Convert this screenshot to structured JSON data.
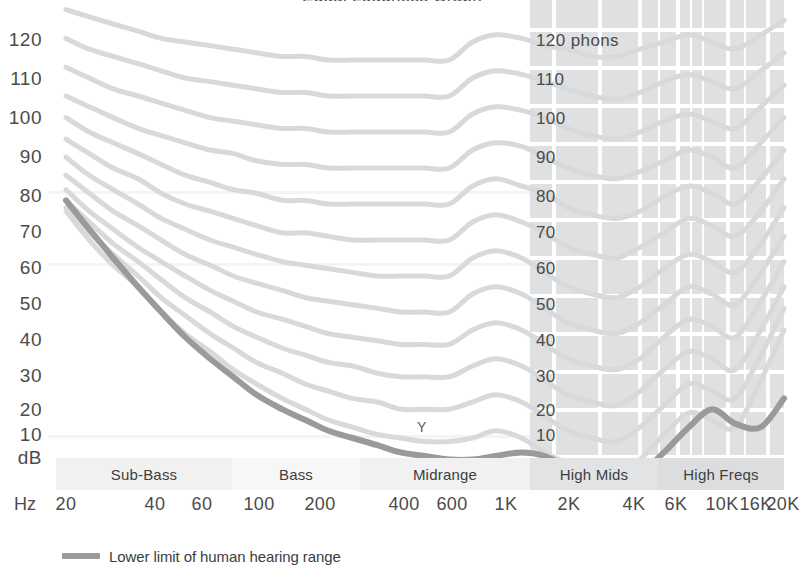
{
  "title": "Equal Loudness Graph",
  "axes": {
    "y_unit": "dB",
    "x_unit": "Hz",
    "y_ticks": [
      "120",
      "110",
      "100",
      "90",
      "80",
      "70",
      "60",
      "50",
      "40",
      "30",
      "20",
      "10"
    ],
    "x_ticks": [
      "20",
      "40",
      "60",
      "100",
      "200",
      "400",
      "600",
      "1K",
      "2K",
      "4K",
      "6K",
      "10K",
      "16K",
      "20K"
    ]
  },
  "phon_labels": [
    "120 phons",
    "110",
    "100",
    "90",
    "80",
    "70",
    "60",
    "50",
    "40",
    "30",
    "20",
    "10"
  ],
  "bands": [
    {
      "label": "Sub-Bass"
    },
    {
      "label": "Bass"
    },
    {
      "label": "Midrange"
    },
    {
      "label": "High Mids"
    },
    {
      "label": "High Freqs"
    }
  ],
  "annotation": "Y",
  "legend": {
    "label": "Lower limit of human hearing range",
    "color": "#9a9a9a"
  },
  "colors": {
    "contour": "#d8d9db",
    "threshold": "#9a9a9a",
    "panel": "#dfe0e2",
    "grid": "#ffffff",
    "text": "#4b4b4b"
  },
  "chart_data": {
    "type": "line",
    "title": "Equal Loudness Graph",
    "xlabel": "Hz",
    "ylabel": "dB",
    "xscale": "log",
    "xlim": [
      20,
      20000
    ],
    "ylim": [
      0,
      130
    ],
    "grid": "partial (white grid over shaded high-frequency panel)",
    "legend": "bottom-left",
    "x": [
      20,
      25,
      31.5,
      40,
      50,
      63,
      80,
      100,
      125,
      160,
      200,
      250,
      315,
      400,
      500,
      630,
      800,
      1000,
      1250,
      1600,
      2000,
      2500,
      3150,
      4000,
      5000,
      6300,
      8000,
      10000,
      12500,
      16000,
      20000
    ],
    "series": [
      {
        "name": "120 phons",
        "phon": 120,
        "values": [
          129,
          127,
          125,
          123,
          121,
          120,
          119,
          118,
          117,
          116,
          116,
          115,
          115,
          115,
          115,
          115,
          115,
          120,
          122,
          121,
          119,
          118,
          116,
          116,
          118,
          120,
          122,
          120,
          118,
          122,
          126
        ]
      },
      {
        "name": "110 phons",
        "phon": 110,
        "values": [
          121,
          118,
          116,
          114,
          112,
          110,
          109,
          108,
          107,
          106,
          106,
          105,
          105,
          105,
          105,
          105,
          105,
          110,
          112,
          111,
          109,
          107,
          105,
          104,
          106,
          109,
          111,
          109,
          107,
          112,
          117
        ]
      },
      {
        "name": "100 phons",
        "phon": 100,
        "values": [
          113,
          110,
          107,
          105,
          103,
          101,
          99,
          98,
          97,
          96,
          96,
          95,
          95,
          95,
          95,
          95,
          95,
          100,
          102,
          101,
          99,
          96,
          94,
          93,
          95,
          98,
          100,
          98,
          96,
          102,
          108
        ]
      },
      {
        "name": "90 phons",
        "phon": 90,
        "values": [
          105,
          102,
          99,
          96,
          94,
          92,
          90,
          89,
          87,
          86,
          86,
          85,
          85,
          85,
          85,
          85,
          85,
          90,
          92,
          91,
          88,
          85,
          83,
          82,
          84,
          87,
          90,
          88,
          85,
          92,
          99
        ]
      },
      {
        "name": "80 phons",
        "phon": 80,
        "values": [
          99,
          95,
          92,
          89,
          86,
          83,
          81,
          79,
          78,
          76,
          76,
          75,
          75,
          75,
          75,
          75,
          75,
          80,
          82,
          80,
          78,
          74,
          72,
          71,
          73,
          77,
          80,
          78,
          75,
          82,
          90
        ]
      },
      {
        "name": "70 phons",
        "phon": 70,
        "values": [
          93,
          89,
          85,
          82,
          78,
          75,
          73,
          71,
          69,
          67,
          67,
          66,
          65,
          65,
          65,
          65,
          65,
          70,
          72,
          70,
          67,
          63,
          61,
          60,
          63,
          67,
          71,
          69,
          66,
          73,
          82
        ]
      },
      {
        "name": "60 phons",
        "phon": 60,
        "values": [
          88,
          83,
          79,
          75,
          71,
          68,
          65,
          63,
          61,
          59,
          58,
          57,
          56,
          55,
          55,
          55,
          55,
          60,
          62,
          60,
          56,
          52,
          50,
          49,
          52,
          57,
          61,
          59,
          56,
          64,
          74
        ]
      },
      {
        "name": "50 phons",
        "phon": 50,
        "values": [
          83,
          78,
          73,
          69,
          65,
          61,
          58,
          55,
          53,
          51,
          49,
          48,
          47,
          46,
          45,
          45,
          45,
          50,
          52,
          50,
          46,
          42,
          40,
          39,
          42,
          47,
          52,
          50,
          47,
          56,
          66
        ]
      },
      {
        "name": "40 phons",
        "phon": 40,
        "values": [
          79,
          73,
          68,
          63,
          59,
          55,
          51,
          48,
          45,
          43,
          41,
          39,
          38,
          37,
          36,
          36,
          36,
          40,
          42,
          40,
          36,
          32,
          30,
          29,
          32,
          38,
          43,
          41,
          38,
          48,
          59
        ]
      },
      {
        "name": "30 phons",
        "phon": 30,
        "values": [
          76,
          70,
          64,
          59,
          54,
          49,
          45,
          41,
          38,
          35,
          33,
          31,
          30,
          28,
          27,
          27,
          27,
          30,
          32,
          30,
          26,
          22,
          20,
          19,
          23,
          29,
          34,
          32,
          29,
          40,
          52
        ]
      },
      {
        "name": "20 phons",
        "phon": 20,
        "values": [
          74,
          67,
          61,
          55,
          49,
          44,
          39,
          35,
          31,
          28,
          25,
          23,
          21,
          20,
          18,
          18,
          18,
          20,
          22,
          20,
          16,
          12,
          10,
          9,
          13,
          19,
          25,
          23,
          21,
          33,
          46
        ]
      },
      {
        "name": "10 phons",
        "phon": 10,
        "values": [
          73,
          65,
          58,
          52,
          45,
          39,
          34,
          29,
          25,
          21,
          18,
          15,
          13,
          11,
          10,
          9,
          9,
          10,
          12,
          10,
          6,
          3,
          1,
          0,
          4,
          11,
          17,
          15,
          13,
          26,
          40
        ]
      },
      {
        "name": "Lower limit of human hearing range",
        "phon": 0,
        "threshold": true,
        "values": [
          76,
          68,
          60,
          52,
          45,
          38,
          32,
          27,
          22,
          18,
          15,
          12,
          10,
          8,
          6,
          5,
          4,
          4,
          5,
          6,
          5,
          2,
          0,
          -2,
          0,
          6,
          13,
          18,
          14,
          13,
          21
        ]
      }
    ]
  }
}
